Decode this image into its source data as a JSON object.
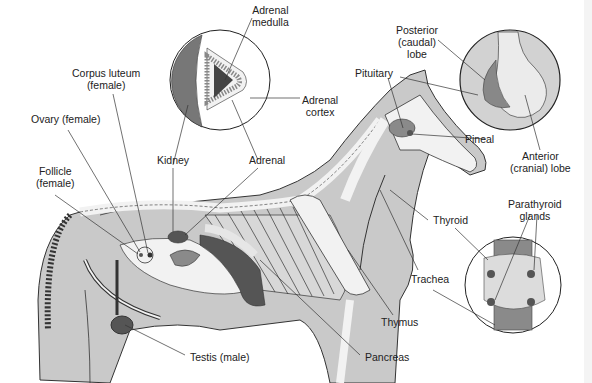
{
  "figure": {
    "colors": {
      "body_fill": "#c9c9c9",
      "outline": "#333333",
      "bone": "#f2f2f2",
      "dark_organ": "#555555",
      "mid_organ": "#8a8a8a",
      "background": "#ffffff"
    }
  },
  "labels": {
    "adrenal_medulla": "Adrenal\nmedulla",
    "adrenal_cortex": "Adrenal\ncortex",
    "corpus_luteum": "Corpus luteum\n(female)",
    "ovary": "Ovary (female)",
    "follicle": "Follicle\n(female)",
    "kidney": "Kidney",
    "adrenal": "Adrenal",
    "posterior_lobe": "Posterior\n(caudal)\nlobe",
    "pituitary": "Pituitary",
    "pineal": "Pineal",
    "anterior_lobe": "Anterior\n(cranial) lobe",
    "thyroid": "Thyroid",
    "parathyroid": "Parathyroid\nglands",
    "trachea": "Trachea",
    "thymus": "Thymus",
    "pancreas": "Pancreas",
    "testis": "Testis (male)"
  }
}
